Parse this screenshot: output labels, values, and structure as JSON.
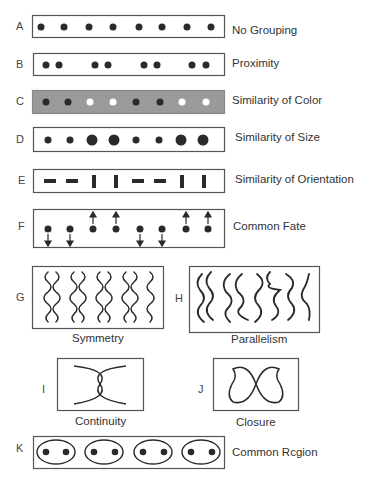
{
  "colors": {
    "ink": "#2a2a2a",
    "box_border": "#555555",
    "gray_fill": "#9a9a9a",
    "white_dot": "#ffffff"
  },
  "panels": [
    {
      "letter": "A",
      "label": "No Grouping"
    },
    {
      "letter": "B",
      "label": "Proximity"
    },
    {
      "letter": "C",
      "label": "Similarity of Color"
    },
    {
      "letter": "D",
      "label": "Similarity of Size"
    },
    {
      "letter": "E",
      "label": "Similarity of Orientation"
    },
    {
      "letter": "F",
      "label": "Common Fate"
    },
    {
      "letter": "G",
      "label": "Symmetry"
    },
    {
      "letter": "H",
      "label": "Parallelism"
    },
    {
      "letter": "I",
      "label": "Continuity"
    },
    {
      "letter": "J",
      "label": "Closure"
    },
    {
      "letter": "K",
      "label": "Common Rcgion"
    }
  ],
  "figures": {
    "A": {
      "dot_x": [
        41,
        64,
        89,
        113,
        139,
        162,
        187,
        211
      ],
      "dot_r": 3.5
    },
    "B": {
      "dot_x": [
        46,
        59,
        95,
        108,
        144,
        157,
        192,
        206
      ],
      "dot_r": 3.5
    },
    "C": {
      "dot_x": [
        46,
        68,
        90,
        113,
        136,
        160,
        182,
        206
      ],
      "dot_colors": [
        "dark",
        "dark",
        "white",
        "white",
        "dark",
        "dark",
        "white",
        "white"
      ]
    },
    "D": {
      "dot_x": [
        48,
        70,
        92,
        114,
        136,
        159,
        181,
        203
      ],
      "dot_sizes": [
        "small",
        "small",
        "large",
        "large",
        "small",
        "small",
        "large",
        "large"
      ]
    },
    "E": {
      "bar_x": [
        50,
        72,
        94,
        116,
        138,
        160,
        182,
        204
      ],
      "orientations": [
        "h",
        "h",
        "v",
        "v",
        "h",
        "h",
        "v",
        "v"
      ]
    },
    "F": {
      "dot_x": [
        48,
        70,
        93,
        116,
        140,
        162,
        186,
        208
      ],
      "motion": [
        "down",
        "down",
        "up",
        "up",
        "down",
        "down",
        "up",
        "up"
      ]
    },
    "K": {
      "region_count": 4,
      "dots_per_region": 2
    }
  }
}
